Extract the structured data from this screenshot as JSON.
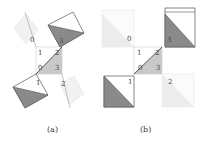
{
  "panels": [
    {
      "caption": "(a)",
      "labels": {
        "q0": "0",
        "q1": "1",
        "q2": "2",
        "q3": "3",
        "c0": "0",
        "c1": "1",
        "c2": "2",
        "c3": "3"
      }
    },
    {
      "caption": "(b)",
      "labels": {
        "q0": "0",
        "q1": "1",
        "q2": "2",
        "q3": "3",
        "c0": "0",
        "c1": "1",
        "c2": "2",
        "c3": "3"
      }
    }
  ],
  "colors": {
    "dark_fill": "#8a8a8a",
    "center_fill": "#c8c8c8",
    "faint_fill": "#ececec",
    "stroke": "#555555",
    "faint_stroke": "#dddddd"
  }
}
